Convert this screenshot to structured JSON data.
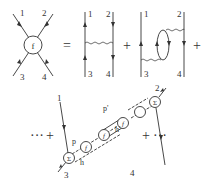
{
  "diagram": {
    "equation": {
      "lhs": {
        "vertex_label": "f",
        "legs": [
          "1",
          "2",
          "3",
          "4"
        ]
      },
      "equals": "=",
      "term1": {
        "legs": [
          "1",
          "2",
          "3",
          "4"
        ],
        "description": "single wavy exchange"
      },
      "plus1": "+",
      "term2": {
        "legs": [
          "1",
          "2",
          "3",
          "4"
        ],
        "description": "wavy lines with bubble loop"
      },
      "plus2": "+",
      "row2": {
        "leading_dots": "···",
        "plus_left": "+",
        "legs": [
          "1",
          "2",
          "3",
          "4"
        ],
        "vertices": [
          "Σ",
          "f",
          "f",
          "f",
          "Σ"
        ],
        "line_labels": {
          "p": "p",
          "h": "h",
          "p_prime": "p'",
          "h_prime": "h'"
        },
        "plus_right": "+",
        "trailing_dots": "···"
      }
    }
  }
}
